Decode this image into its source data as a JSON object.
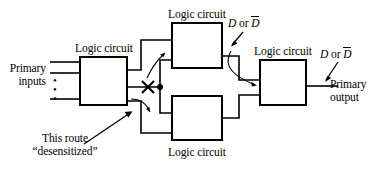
{
  "figure": {
    "background_color": "#ffffff",
    "line_color": "#000000",
    "width": 378,
    "height": 170
  },
  "blocks": [
    {
      "id": "left",
      "label": "Logic circuit",
      "label_position": "above",
      "x": 80,
      "y": 57,
      "w": 47,
      "h": 48
    },
    {
      "id": "top",
      "label": "Logic circuit",
      "label_position": "above",
      "x": 172,
      "y": 23,
      "w": 50,
      "h": 45
    },
    {
      "id": "bottom",
      "label": "Logic circuit",
      "label_position": "below",
      "x": 172,
      "y": 96,
      "w": 50,
      "h": 44
    },
    {
      "id": "right",
      "label": "Logic circuit",
      "label_position": "above",
      "x": 260,
      "y": 60,
      "w": 46,
      "h": 45
    }
  ],
  "labels": {
    "primary_inputs_line1": "Primary",
    "primary_inputs_line2": "inputs",
    "primary_output_line1": "Primary",
    "primary_output_line2": "output",
    "block_left": "Logic circuit",
    "block_top": "Logic circuit",
    "block_bottom": "Logic circuit",
    "block_right": "Logic circuit",
    "d_or_dbar_top_prefix": "D",
    "d_or_dbar_top_conj": "or",
    "d_or_dbar_top_suffix": "D",
    "d_or_dbar_right_prefix": "D",
    "d_or_dbar_right_conj": "or",
    "d_or_dbar_right_suffix": "D",
    "desensitized_line1": "This route",
    "desensitized_line2": "“desensitized”"
  },
  "annotations": {
    "blocked_route_marker": "X",
    "junction_marker": "dot",
    "vertical_ellipsis_inputs": "⋮"
  }
}
